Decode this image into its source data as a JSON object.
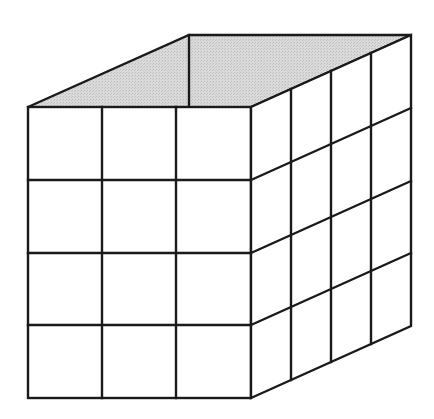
{
  "diagram": {
    "shape": "rectangular prism (box) in oblique projection",
    "top_fill": "#d4d4d4",
    "stroke": "#1a1a1a",
    "front_face": {
      "columns": 3,
      "rows": 4
    },
    "side_face": {
      "columns": 4,
      "rows": 4
    },
    "dimensions_in_units": {
      "width": 3,
      "depth": 4,
      "height": 4
    }
  }
}
